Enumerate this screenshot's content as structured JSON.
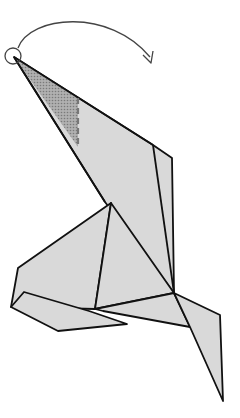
{
  "diagram": {
    "instruction": "reverse fold the tip along the dashed line (rotate head over)",
    "colors": {
      "paper": "#d9d9d9",
      "paper_shaded": "#9a9a9a",
      "outline": "#111111",
      "arrow": "#444444",
      "background": "#ffffff"
    },
    "symbols": [
      {
        "name": "circle-marker",
        "meaning": "point to move"
      },
      {
        "name": "curved-arrow",
        "meaning": "fold direction"
      },
      {
        "name": "dashed-fold-line",
        "meaning": "valley fold line"
      }
    ]
  }
}
